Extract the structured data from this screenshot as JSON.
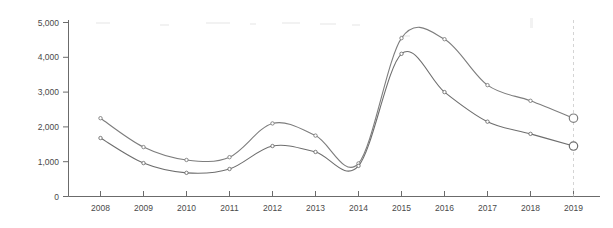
{
  "chart_data": {
    "type": "line",
    "title": "",
    "subtitle": "",
    "xlabel": "",
    "ylabel": "",
    "categories": [
      "2008",
      "2009",
      "2010",
      "2011",
      "2012",
      "2013",
      "2014",
      "2015",
      "2016",
      "2017",
      "2018",
      "2019"
    ],
    "x": [
      2008,
      2009,
      2010,
      2011,
      2012,
      2013,
      2014,
      2015,
      2016,
      2017,
      2018,
      2019
    ],
    "ylim": [
      0,
      5000
    ],
    "xlim": [
      2008,
      2019
    ],
    "y_ticks": [
      0,
      1000,
      2000,
      3000,
      4000,
      5000
    ],
    "y_tick_labels": [
      "0",
      "1,000",
      "2,000",
      "3,000",
      "4,000",
      "5,000"
    ],
    "grid": false,
    "legend": "none",
    "series": [
      {
        "name": "upper-series",
        "color": "#7d7d7d",
        "values": [
          2250,
          1420,
          1050,
          1130,
          2100,
          1750,
          950,
          4550,
          4520,
          3200,
          2750,
          2250
        ]
      },
      {
        "name": "lower-series",
        "color": "#6e6e6e",
        "values": [
          1680,
          960,
          680,
          790,
          1450,
          1280,
          880,
          4100,
          3000,
          2150,
          1800,
          1450
        ]
      }
    ],
    "annotations": {
      "end_reference_line_x": "2019"
    }
  },
  "axes": {
    "y_labels": [
      "5,000",
      "4,000",
      "3,000",
      "2,000",
      "1,000",
      "0"
    ],
    "x_labels": [
      "2008",
      "2009",
      "2010",
      "2011",
      "2012",
      "2013",
      "2014",
      "2015",
      "2016",
      "2017",
      "2018",
      "2019"
    ]
  }
}
